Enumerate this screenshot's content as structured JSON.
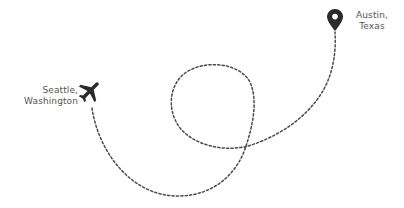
{
  "origin": {
    "line1": "Seattle,",
    "line2": "Washington",
    "icon": "airplane-icon"
  },
  "destination": {
    "line1": "Austin,",
    "line2": "Texas",
    "icon": "map-pin-icon"
  },
  "route": {
    "style": "dashed",
    "color": "#4a4a4a"
  },
  "colors": {
    "icon": "#2b2b2b",
    "text": "#555555",
    "background": "#ffffff"
  }
}
